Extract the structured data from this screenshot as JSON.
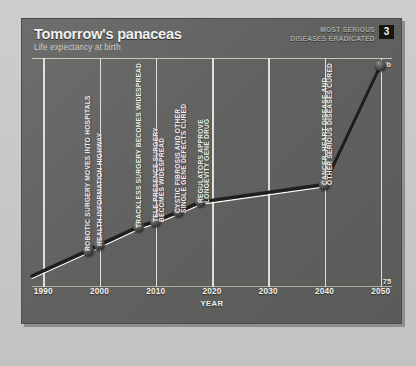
{
  "panel": {
    "title": "Tomorrow's panaceas",
    "subtitle": "Life expectancy at birth",
    "badge": "3",
    "top_note": "MOST SERIOUS\nDISEASES ERADICATED",
    "colors": {
      "panel_dark": "#616160",
      "line_dark": "#1f1f1e",
      "line_highlight": "#ffffff",
      "gridline": "#ececea",
      "text_light": "#f0f0ec",
      "badge_bg": "#17170f"
    }
  },
  "chart_data": {
    "type": "line",
    "title": "Tomorrow's panaceas",
    "subtitle": "Life expectancy at birth",
    "xlabel": "YEAR",
    "ylabel": "",
    "xlim": [
      1988,
      2052
    ],
    "ylim": [
      75,
      100
    ],
    "ytick_labels": [
      "10b",
      "75"
    ],
    "xtick_labels": [
      "1990",
      "2000",
      "2010",
      "2020",
      "2030",
      "2040",
      "2050"
    ],
    "xticks": [
      1990,
      2000,
      2010,
      2020,
      2030,
      2040,
      2050
    ],
    "grid": "vertical",
    "legend": "none",
    "series": [
      {
        "name": "Life expectancy at birth",
        "x": [
          1988,
          1998,
          2000,
          2007,
          2010,
          2014,
          2018,
          2040,
          2050
        ],
        "y": [
          76.2,
          79.0,
          79.6,
          81.6,
          82.2,
          83.2,
          84.3,
          86.2,
          99.2
        ]
      }
    ],
    "markers": [
      {
        "year": 1998,
        "value": 79.0
      },
      {
        "year": 2000,
        "value": 79.6
      },
      {
        "year": 2007,
        "value": 81.6
      },
      {
        "year": 2010,
        "value": 82.2
      },
      {
        "year": 2014,
        "value": 83.2
      },
      {
        "year": 2018,
        "value": 84.3
      },
      {
        "year": 2040,
        "value": 86.2
      },
      {
        "year": 2050,
        "value": 99.2
      }
    ],
    "annotations": [
      {
        "text": "ROBOTIC SURGERY MOVES INTO HOSPITALS",
        "year": 1998
      },
      {
        "text": "HEALTH INFORMATION HIGHWAY",
        "year": 2000
      },
      {
        "text": "TRACKLESS SURGERY BECOMES WIDESPREAD",
        "year": 2007
      },
      {
        "text": "TELE-PRESENCE SURGERY",
        "year": 2010
      },
      {
        "text": "BECOMES WIDESPREAD",
        "year": 2011
      },
      {
        "text": "CYSTIC FIBROSIS AND OTHER",
        "year": 2014
      },
      {
        "text": "SINGLE GENE DEFECTS CURED",
        "year": 2015
      },
      {
        "text": "REGULATORS APPROVE",
        "year": 2018
      },
      {
        "text": "LONGEVITY GENE DRUG",
        "year": 2019
      },
      {
        "text": "CANCER, HEART DISEASE AND",
        "year": 2040
      },
      {
        "text": "OTHER SERIOUS DISEASES CURED",
        "year": 2041
      },
      {
        "text": "MOST SERIOUS DISEASES ERADICATED",
        "year": 2050
      }
    ]
  }
}
